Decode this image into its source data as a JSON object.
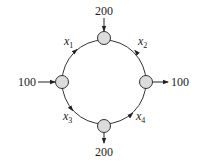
{
  "diagram": {
    "type": "network-flow",
    "colors": {
      "node_fill": "#dcdcdc",
      "stroke": "#333333",
      "background": "#ffffff"
    },
    "nodes": [
      {
        "id": "top",
        "position": "top"
      },
      {
        "id": "right",
        "position": "right"
      },
      {
        "id": "bottom",
        "position": "bottom"
      },
      {
        "id": "left",
        "position": "left"
      }
    ],
    "external_flows": {
      "top_in": "200",
      "left_in": "100",
      "right_out": "100",
      "bottom_out": "200"
    },
    "edges": [
      {
        "var": "x",
        "sub": "1",
        "from": "left",
        "to": "top"
      },
      {
        "var": "x",
        "sub": "2",
        "from": "right",
        "to": "top"
      },
      {
        "var": "x",
        "sub": "3",
        "from": "left",
        "to": "bottom"
      },
      {
        "var": "x",
        "sub": "4",
        "from": "bottom",
        "to": "right"
      }
    ]
  }
}
